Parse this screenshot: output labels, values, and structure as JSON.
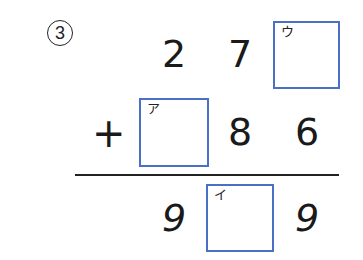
{
  "problem": {
    "number_label": "3",
    "operator": "+",
    "row1": {
      "digits": [
        "2",
        "7"
      ],
      "blank": {
        "label": "ウ"
      }
    },
    "row2": {
      "blank": {
        "label": "ア"
      },
      "digits": [
        "8",
        "6"
      ]
    },
    "result": {
      "digits": [
        "9",
        "9"
      ],
      "blank": {
        "label": "イ"
      }
    }
  },
  "colors": {
    "box_border": "#4a6fc4",
    "text": "#1a1a1a",
    "background": "#ffffff"
  }
}
